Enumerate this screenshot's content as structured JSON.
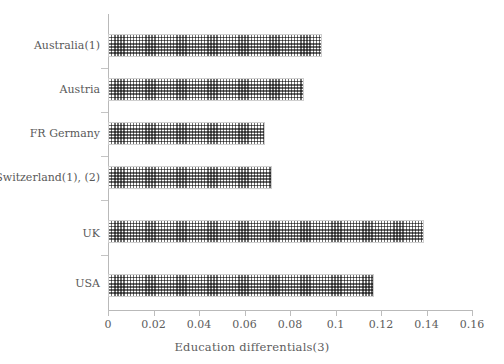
{
  "chart_data": {
    "type": "bar",
    "orientation": "horizontal",
    "title": "",
    "xlabel": "Education differentials(3)",
    "ylabel": "",
    "xlim": [
      0,
      0.16
    ],
    "xticks": [
      "0",
      "0.02",
      "0.04",
      "0.06",
      "0.08",
      "0.1",
      "0.12",
      "0.14",
      "0.16"
    ],
    "xtick_values": [
      0,
      0.02,
      0.04,
      0.06,
      0.08,
      0.1,
      0.12,
      0.14,
      0.16
    ],
    "grid": false,
    "legend": false,
    "categories": [
      "Australia(1)",
      "Austria",
      "FR Germany",
      "Switzerland(1), (2)",
      "UK",
      "USA"
    ],
    "values": [
      0.094,
      0.086,
      0.069,
      0.072,
      0.139,
      0.117
    ],
    "series": [
      {
        "name": "Education differentials",
        "values": [
          0.094,
          0.086,
          0.069,
          0.072,
          0.139,
          0.117
        ]
      }
    ],
    "bar_fill": "dotted-hatch",
    "bar_color": "#6e6e6e",
    "axis_color": "#b9b9b9",
    "text_color": "#5a5a5a"
  }
}
